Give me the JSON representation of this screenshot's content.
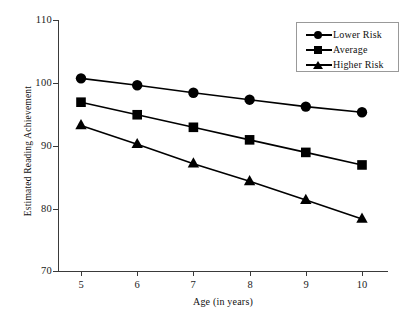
{
  "chart_data": {
    "type": "line",
    "title": "",
    "xlabel": "Age (in years)",
    "ylabel": "Estimated Reading Achievement",
    "x": [
      5,
      6,
      7,
      8,
      9,
      10
    ],
    "xtick_labels": [
      "5",
      "6",
      "7",
      "8",
      "9",
      "10"
    ],
    "ytick_labels": [
      "70",
      "80",
      "90",
      "100",
      "110"
    ],
    "yticks": [
      70,
      80,
      90,
      100,
      110
    ],
    "xlim": [
      4.6,
      10.5
    ],
    "ylim": [
      70,
      110
    ],
    "grid": false,
    "legend_position": "top-right",
    "series": [
      {
        "name": "Lower Risk",
        "marker": "circle",
        "color": "#000000",
        "values": [
          100.7,
          99.6,
          98.4,
          97.3,
          96.2,
          95.3
        ]
      },
      {
        "name": "Average",
        "marker": "square",
        "color": "#000000",
        "values": [
          96.9,
          94.9,
          92.9,
          90.9,
          88.9,
          86.9
        ]
      },
      {
        "name": "Higher Risk",
        "marker": "triangle",
        "color": "#000000",
        "values": [
          93.2,
          90.2,
          87.1,
          84.3,
          81.3,
          78.3
        ]
      }
    ]
  },
  "legend": {
    "items": [
      {
        "label": "Lower Risk",
        "marker": "circle"
      },
      {
        "label": "Average",
        "marker": "square"
      },
      {
        "label": "Higher Risk",
        "marker": "triangle"
      }
    ]
  },
  "axes": {
    "x_title": "Age (in years)",
    "y_title": "Estimated Reading Achievement",
    "x_labels": [
      "5",
      "6",
      "7",
      "8",
      "9",
      "10"
    ],
    "y_labels": [
      "110",
      "100",
      "90",
      "80",
      "70"
    ]
  }
}
